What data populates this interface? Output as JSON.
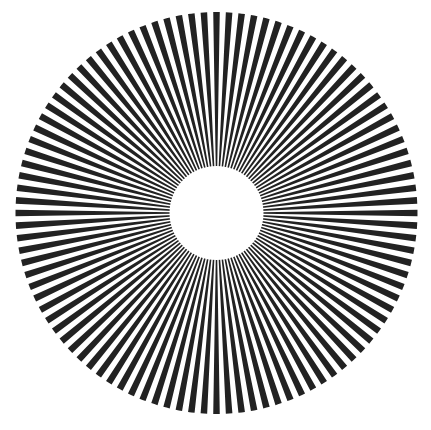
{
  "pattern": {
    "type": "siemens-star",
    "canvas": {
      "width": 431,
      "height": 430,
      "background": "#ffffff"
    },
    "center": {
      "x": 216.5,
      "y": 213
    },
    "outer_radius": 201,
    "inner_radius": 47,
    "spoke_count": 100,
    "spoke_duty": 0.52,
    "start_angle_deg": -90,
    "spoke_color": "#222222",
    "inner_disk_color": "#ffffff"
  }
}
